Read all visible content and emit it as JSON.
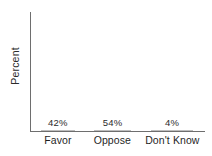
{
  "chart_data": {
    "type": "bar",
    "title": "",
    "subtitle": "",
    "xlabel": "",
    "ylabel": "Percent",
    "categories": [
      "Favor",
      "Oppose",
      "Don't Know"
    ],
    "values": [
      42,
      54,
      4
    ],
    "value_labels": [
      "42%",
      "54%",
      "4%"
    ],
    "ylim": [
      0,
      60
    ],
    "grid": false,
    "legend": null,
    "series": [
      {
        "name": "Percent",
        "values": [
          42,
          54,
          4
        ]
      }
    ],
    "annotations": [],
    "colors": {
      "bar_light": "#cfcfcf",
      "bar_dark": "#a8a8a8",
      "bar_flat": "#b8b8b8",
      "axis": "#6e6e6e",
      "text": "#1f1f1f",
      "background": "#ffffff"
    }
  },
  "axis": {
    "y_title": "Percent"
  },
  "bars": [
    {
      "label": "Favor",
      "value_label": "42%",
      "left_pct": 5.7,
      "width_pct": 19.5,
      "height_pct": 54.0,
      "fill": "light"
    },
    {
      "label": "Oppose",
      "value_label": "54%",
      "left_pct": 36.2,
      "width_pct": 21.3,
      "height_pct": 67.5,
      "fill": "dark"
    },
    {
      "label": "Don't Know",
      "value_label": "4%",
      "left_pct": 69.0,
      "width_pct": 24.1,
      "height_pct": 4.2,
      "fill": "flat"
    }
  ],
  "category_label_positions": [
    {
      "left_pct": 0.0,
      "width_pct": 31.0
    },
    {
      "left_pct": 31.0,
      "width_pct": 31.5
    },
    {
      "left_pct": 62.5,
      "width_pct": 37.5
    }
  ]
}
